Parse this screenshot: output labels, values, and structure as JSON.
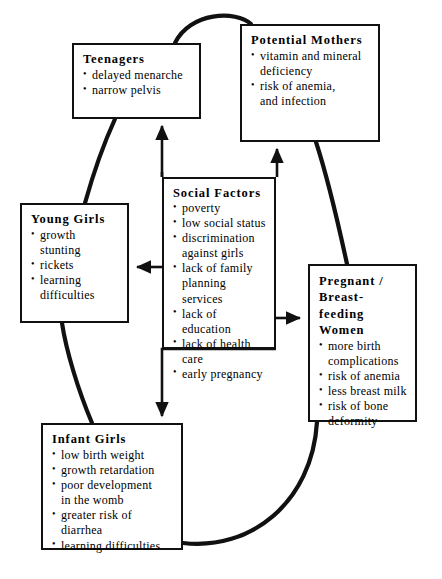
{
  "diagram": {
    "type": "lifecycle-cycle-diagram",
    "theme_color": "#111111",
    "background": "#ffffff",
    "nodes": [
      {
        "id": "teenagers",
        "title": "Teenagers",
        "items": [
          "delayed menarche",
          "narrow pelvis"
        ]
      },
      {
        "id": "potential_mothers",
        "title": "Potential  Mothers",
        "items": [
          "vitamin and mineral\ndeficiency",
          "risk of anemia,\nand infection"
        ]
      },
      {
        "id": "social_factors",
        "title": "Social  Factors",
        "items": [
          "poverty",
          "low social status",
          "discrimination\nagainst girls",
          "lack of family\nplanning services",
          "lack of education",
          "lack of health care",
          "early pregnancy"
        ]
      },
      {
        "id": "young_girls",
        "title": "Young  Girls",
        "items": [
          "growth\nstunting",
          "rickets",
          "learning\ndifficulties"
        ]
      },
      {
        "id": "pregnant_women",
        "title": "Pregnant  /\nBreast-feeding\nWomen",
        "items": [
          "more birth\ncomplications",
          "risk of anemia",
          "less breast milk",
          "risk of bone\ndeformity"
        ]
      },
      {
        "id": "infant_girls",
        "title": "Infant  Girls",
        "items": [
          "low birth weight",
          "growth retardation",
          "poor development\nin the womb",
          "greater risk of diarrhea",
          "learning difficulties"
        ]
      }
    ],
    "edges": [
      {
        "id": "teenagers-to-potential-mothers",
        "from": "teenagers",
        "to": "potential_mothers",
        "style": "curve",
        "arrowhead": false
      },
      {
        "id": "potential-mothers-to-pregnant-women",
        "from": "potential_mothers",
        "to": "pregnant_women",
        "style": "curve",
        "arrowhead": false
      },
      {
        "id": "pregnant-women-to-infant-girls",
        "from": "pregnant_women",
        "to": "infant_girls",
        "style": "curve",
        "arrowhead": false
      },
      {
        "id": "infant-girls-to-young-girls",
        "from": "infant_girls",
        "to": "young_girls",
        "style": "curve",
        "arrowhead": false
      },
      {
        "id": "young-girls-to-teenagers",
        "from": "young_girls",
        "to": "teenagers",
        "style": "curve",
        "arrowhead": false
      },
      {
        "id": "social-factors-to-teenagers",
        "from": "social_factors",
        "to": "teenagers",
        "style": "straight",
        "arrowhead": true
      },
      {
        "id": "social-factors-to-potential-mothers",
        "from": "social_factors",
        "to": "potential_mothers",
        "style": "straight",
        "arrowhead": true
      },
      {
        "id": "social-factors-to-young-girls",
        "from": "social_factors",
        "to": "young_girls",
        "style": "straight",
        "arrowhead": true
      },
      {
        "id": "social-factors-to-pregnant-women",
        "from": "social_factors",
        "to": "pregnant_women",
        "style": "straight",
        "arrowhead": true
      },
      {
        "id": "social-factors-to-infant-girls",
        "from": "social_factors",
        "to": "infant_girls",
        "style": "straight",
        "arrowhead": true
      }
    ]
  }
}
